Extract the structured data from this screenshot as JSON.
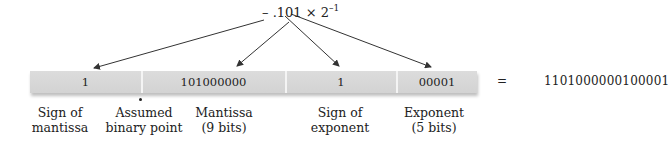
{
  "formula": {
    "prefix": "– .101 × 2",
    "exponent": "–1"
  },
  "fields": [
    {
      "id": "sign-mantissa",
      "value": "1"
    },
    {
      "id": "mantissa",
      "value": "101000000"
    },
    {
      "id": "sign-exponent",
      "value": "1"
    },
    {
      "id": "exponent",
      "value": "00001"
    }
  ],
  "labels": {
    "sign_mantissa": [
      "Sign of",
      "mantissa"
    ],
    "binary_point": [
      "Assumed",
      "binary point"
    ],
    "mantissa": [
      "Mantissa",
      "(9 bits)"
    ],
    "sign_exponent": [
      "Sign of",
      "exponent"
    ],
    "exponent": [
      "Exponent",
      "(5 bits)"
    ]
  },
  "equals": "=",
  "result": "1101000000100001"
}
